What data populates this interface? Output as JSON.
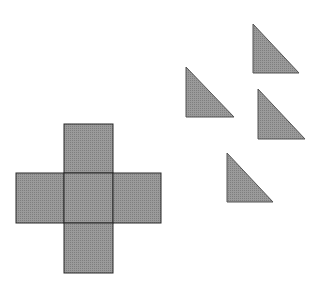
{
  "canvas": {
    "width": 314,
    "height": 294,
    "background": "#ffffff"
  },
  "style": {
    "fill": "#8f8f8f",
    "stroke": "#2a2a2a"
  },
  "cross": {
    "squares": [
      {
        "name": "top",
        "x": 64,
        "y": 124,
        "w": 49,
        "h": 49
      },
      {
        "name": "left",
        "x": 16,
        "y": 173,
        "w": 48,
        "h": 50
      },
      {
        "name": "center",
        "x": 64,
        "y": 173,
        "w": 49,
        "h": 50
      },
      {
        "name": "right",
        "x": 113,
        "y": 173,
        "w": 48,
        "h": 50
      },
      {
        "name": "bottom",
        "x": 64,
        "y": 223,
        "w": 49,
        "h": 50
      }
    ]
  },
  "triangles": [
    {
      "name": "triangle-1",
      "points": "253,24 253,73 299,73"
    },
    {
      "name": "triangle-2",
      "points": "186,67 186,117 234,117"
    },
    {
      "name": "triangle-3",
      "points": "258,89 258,139 305,139"
    },
    {
      "name": "triangle-4",
      "points": "227,153 227,202 273,202"
    }
  ]
}
